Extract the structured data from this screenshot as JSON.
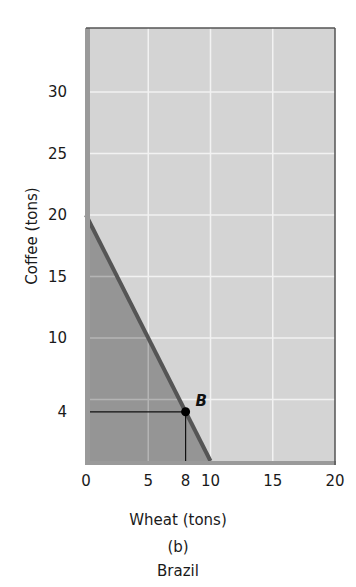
{
  "chart_data": {
    "type": "line",
    "title": "Brazil",
    "subtitle": "(b)",
    "xlabel": "Wheat (tons)",
    "ylabel": "Coffee (tons)",
    "xlim": [
      0,
      20
    ],
    "ylim": [
      0,
      35
    ],
    "x_ticks": [
      0,
      5,
      8,
      10,
      15,
      20
    ],
    "y_ticks": [
      4,
      10,
      15,
      20,
      25,
      30
    ],
    "x_gridlines": [
      5,
      10,
      15
    ],
    "y_gridlines": [
      5,
      10,
      15,
      20,
      25,
      30
    ],
    "grid": true,
    "series": [
      {
        "name": "Production possibilities frontier",
        "x": [
          0,
          10
        ],
        "y": [
          20,
          0
        ],
        "shaded_below": true
      }
    ],
    "points": [
      {
        "label": "B",
        "x": 8,
        "y": 4,
        "guide_lines": true
      }
    ]
  },
  "labels": {
    "x_axis": "Wheat (tons)",
    "y_axis": "Coffee (tons)",
    "panel": "(b)",
    "country": "Brazil",
    "point_b": "B",
    "origin": "0"
  },
  "colors": {
    "plot_bg": "#d4d4d4",
    "feasible_region": "#8e8e8e",
    "ppf_line": "#555555",
    "grid": "#f2f2f2",
    "axis_strip": "#9a9a9a",
    "border": "#555555"
  }
}
